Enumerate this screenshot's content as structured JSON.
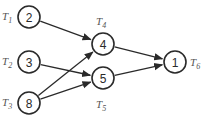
{
  "diagram": {
    "type": "task-dependency-graph",
    "nodes": [
      {
        "id": "T1",
        "label": "T",
        "sub": "1",
        "value": "2",
        "cx": 29,
        "cy": 17,
        "lx": 2,
        "ly": 20
      },
      {
        "id": "T2",
        "label": "T",
        "sub": "2",
        "value": "3",
        "cx": 29,
        "cy": 62,
        "lx": 2,
        "ly": 65
      },
      {
        "id": "T3",
        "label": "T",
        "sub": "3",
        "value": "8",
        "cx": 29,
        "cy": 103,
        "lx": 2,
        "ly": 106
      },
      {
        "id": "T4",
        "label": "T",
        "sub": "4",
        "value": "4",
        "cx": 103,
        "cy": 44,
        "lx": 96,
        "ly": 25
      },
      {
        "id": "T5",
        "label": "T",
        "sub": "5",
        "value": "5",
        "cx": 103,
        "cy": 78,
        "lx": 96,
        "ly": 108
      },
      {
        "id": "T6",
        "label": "T",
        "sub": "6",
        "value": "1",
        "cx": 175,
        "cy": 62,
        "lx": 190,
        "ly": 66
      }
    ],
    "edges": [
      {
        "from": "T1",
        "to": "T4"
      },
      {
        "from": "T2",
        "to": "T5"
      },
      {
        "from": "T3",
        "to": "T4"
      },
      {
        "from": "T3",
        "to": "T5"
      },
      {
        "from": "T4",
        "to": "T6"
      },
      {
        "from": "T5",
        "to": "T6"
      }
    ],
    "colors": {
      "stroke": "#2a2a2a",
      "label": "#555555",
      "background": "#ffffff"
    }
  }
}
